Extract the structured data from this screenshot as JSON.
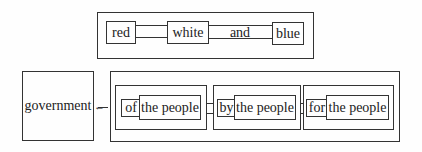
{
  "diagram": {
    "top_group": {
      "items": [
        "red",
        "white",
        "and",
        "blue"
      ]
    },
    "government_label": "government",
    "arrow_glyph": "←",
    "bottom_group": {
      "clauses": [
        {
          "preposition": "of",
          "object": "the people"
        },
        {
          "preposition": "by",
          "object": "the people"
        },
        {
          "preposition": "for",
          "object": "the people"
        }
      ]
    },
    "colors": {
      "line": "#333333",
      "background": "#fefefe",
      "text": "#222222"
    }
  }
}
